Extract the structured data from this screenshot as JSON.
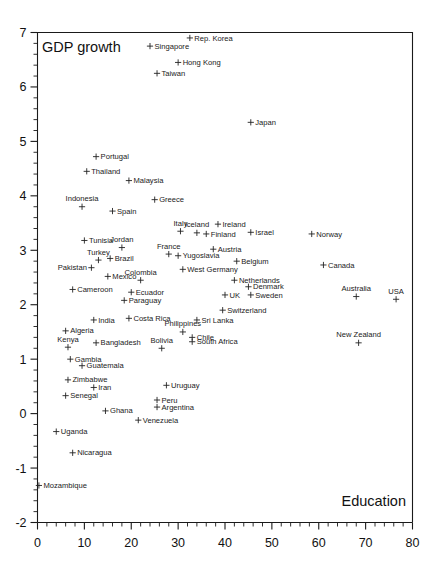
{
  "chart_data": {
    "type": "scatter",
    "title": "",
    "xlabel": "Education",
    "ylabel": "GDP growth",
    "xlim": [
      0,
      80
    ],
    "ylim": [
      -2,
      7
    ],
    "x_major_ticks": [
      0,
      10,
      20,
      30,
      40,
      50,
      60,
      70,
      80
    ],
    "x_tick_labels": [
      "0",
      "10",
      "20",
      "30",
      "40",
      "50",
      "60",
      "70",
      "80"
    ],
    "x_minor_step": 2,
    "y_major_ticks": [
      -2,
      -1,
      0,
      1,
      2,
      3,
      4,
      5,
      6,
      7
    ],
    "y_tick_labels": [
      "-2",
      "-1",
      "0",
      "1",
      "2",
      "3",
      "4",
      "5",
      "6",
      "7"
    ],
    "y_minor_step": 0.2,
    "grid": false,
    "legend": false,
    "marker": "plus",
    "marker_color": "#222222",
    "frame_color": "#1a1a1a",
    "points": [
      {
        "label": "Singapore",
        "x": 24.0,
        "y": 6.75,
        "pos": "right"
      },
      {
        "label": "Rep. Korea",
        "x": 32.5,
        "y": 6.9,
        "pos": "right"
      },
      {
        "label": "Hong Kong",
        "x": 30.0,
        "y": 6.45,
        "pos": "right"
      },
      {
        "label": "Taiwan",
        "x": 25.5,
        "y": 6.25,
        "pos": "right"
      },
      {
        "label": "Japan",
        "x": 45.5,
        "y": 5.35,
        "pos": "right"
      },
      {
        "label": "Portugal",
        "x": 12.5,
        "y": 4.72,
        "pos": "right"
      },
      {
        "label": "Thailand",
        "x": 10.5,
        "y": 4.45,
        "pos": "right"
      },
      {
        "label": "Malaysia",
        "x": 19.5,
        "y": 4.28,
        "pos": "right"
      },
      {
        "label": "Indonesia",
        "x": 9.5,
        "y": 3.8,
        "pos": "above"
      },
      {
        "label": "Spain",
        "x": 16.0,
        "y": 3.72,
        "pos": "right"
      },
      {
        "label": "Greece",
        "x": 25.0,
        "y": 3.93,
        "pos": "right"
      },
      {
        "label": "Italy",
        "x": 30.5,
        "y": 3.35,
        "pos": "above"
      },
      {
        "label": "Iceland",
        "x": 34.0,
        "y": 3.32,
        "pos": "above"
      },
      {
        "label": "Finland",
        "x": 36.0,
        "y": 3.3,
        "pos": "right"
      },
      {
        "label": "Ireland",
        "x": 38.5,
        "y": 3.48,
        "pos": "right"
      },
      {
        "label": "Israel",
        "x": 45.5,
        "y": 3.33,
        "pos": "right"
      },
      {
        "label": "Norway",
        "x": 58.5,
        "y": 3.3,
        "pos": "right"
      },
      {
        "label": "Tunisia",
        "x": 10.0,
        "y": 3.18,
        "pos": "right"
      },
      {
        "label": "Jordan",
        "x": 18.0,
        "y": 3.05,
        "pos": "above"
      },
      {
        "label": "France",
        "x": 28.0,
        "y": 2.93,
        "pos": "above"
      },
      {
        "label": "Yugoslavia",
        "x": 30.0,
        "y": 2.9,
        "pos": "right"
      },
      {
        "label": "Austria",
        "x": 37.5,
        "y": 3.02,
        "pos": "right"
      },
      {
        "label": "Belgium",
        "x": 42.5,
        "y": 2.8,
        "pos": "right"
      },
      {
        "label": "Canada",
        "x": 61.0,
        "y": 2.73,
        "pos": "right"
      },
      {
        "label": "Turkey",
        "x": 13.0,
        "y": 2.82,
        "pos": "above"
      },
      {
        "label": "Brazil",
        "x": 15.5,
        "y": 2.85,
        "pos": "right"
      },
      {
        "label": "Pakistan",
        "x": 11.5,
        "y": 2.68,
        "pos": "left"
      },
      {
        "label": "West Germany",
        "x": 31.0,
        "y": 2.65,
        "pos": "right"
      },
      {
        "label": "Mexico",
        "x": 15.0,
        "y": 2.52,
        "pos": "right"
      },
      {
        "label": "Colombia",
        "x": 22.0,
        "y": 2.45,
        "pos": "above"
      },
      {
        "label": "Netherlands",
        "x": 42.0,
        "y": 2.45,
        "pos": "right"
      },
      {
        "label": "Denmark",
        "x": 45.0,
        "y": 2.33,
        "pos": "right"
      },
      {
        "label": "Cameroon",
        "x": 7.5,
        "y": 2.28,
        "pos": "right"
      },
      {
        "label": "Ecuador",
        "x": 20.0,
        "y": 2.23,
        "pos": "right"
      },
      {
        "label": "UK",
        "x": 40.0,
        "y": 2.18,
        "pos": "right"
      },
      {
        "label": "Sweden",
        "x": 45.5,
        "y": 2.18,
        "pos": "right"
      },
      {
        "label": "Australia",
        "x": 68.0,
        "y": 2.15,
        "pos": "above"
      },
      {
        "label": "USA",
        "x": 76.5,
        "y": 2.1,
        "pos": "above"
      },
      {
        "label": "Paraguay",
        "x": 18.5,
        "y": 2.08,
        "pos": "right"
      },
      {
        "label": "Switzerland",
        "x": 39.5,
        "y": 1.9,
        "pos": "right"
      },
      {
        "label": "India",
        "x": 12.0,
        "y": 1.72,
        "pos": "right"
      },
      {
        "label": "Costa Rica",
        "x": 19.5,
        "y": 1.75,
        "pos": "right"
      },
      {
        "label": "Sri Lanka",
        "x": 34.0,
        "y": 1.72,
        "pos": "right"
      },
      {
        "label": "Algeria",
        "x": 6.0,
        "y": 1.52,
        "pos": "right"
      },
      {
        "label": "Philippines",
        "x": 31.0,
        "y": 1.5,
        "pos": "above"
      },
      {
        "label": "Chile",
        "x": 33.0,
        "y": 1.4,
        "pos": "right"
      },
      {
        "label": "South Africa",
        "x": 33.0,
        "y": 1.32,
        "pos": "right"
      },
      {
        "label": "Kenya",
        "x": 6.5,
        "y": 1.22,
        "pos": "above"
      },
      {
        "label": "Bangladesh",
        "x": 12.5,
        "y": 1.3,
        "pos": "right"
      },
      {
        "label": "New Zealand",
        "x": 68.5,
        "y": 1.3,
        "pos": "above"
      },
      {
        "label": "Bolivia",
        "x": 26.5,
        "y": 1.2,
        "pos": "above"
      },
      {
        "label": "Gambia",
        "x": 7.0,
        "y": 1.0,
        "pos": "right"
      },
      {
        "label": "Guatemala",
        "x": 9.5,
        "y": 0.88,
        "pos": "right"
      },
      {
        "label": "Zimbabwe",
        "x": 6.5,
        "y": 0.62,
        "pos": "right"
      },
      {
        "label": "Iran",
        "x": 12.0,
        "y": 0.48,
        "pos": "right"
      },
      {
        "label": "Uruguay",
        "x": 27.5,
        "y": 0.52,
        "pos": "right"
      },
      {
        "label": "Senegal",
        "x": 6.0,
        "y": 0.33,
        "pos": "right"
      },
      {
        "label": "Peru",
        "x": 25.5,
        "y": 0.25,
        "pos": "right"
      },
      {
        "label": "Argentina",
        "x": 25.5,
        "y": 0.12,
        "pos": "right"
      },
      {
        "label": "Ghana",
        "x": 14.5,
        "y": 0.05,
        "pos": "right"
      },
      {
        "label": "Venezuela",
        "x": 21.5,
        "y": -0.12,
        "pos": "right"
      },
      {
        "label": "Uganda",
        "x": 4.0,
        "y": -0.33,
        "pos": "right"
      },
      {
        "label": "Nicaragua",
        "x": 7.5,
        "y": -0.72,
        "pos": "right"
      },
      {
        "label": "Mozambique",
        "x": 0.3,
        "y": -1.32,
        "pos": "right"
      }
    ]
  }
}
